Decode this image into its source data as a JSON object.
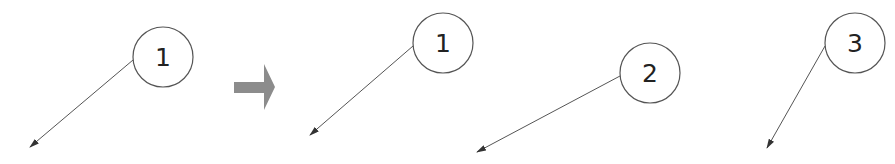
{
  "diagram": {
    "before": {
      "balloons": [
        {
          "label": "1",
          "cx": 163,
          "cy": 57,
          "r": 30,
          "leader": {
            "x1": 133,
            "y1": 60,
            "x2": 30,
            "y2": 147
          }
        }
      ]
    },
    "transition_arrow": {
      "color": "#8c8c8c"
    },
    "after": {
      "balloons": [
        {
          "label": "1",
          "cx": 443,
          "cy": 43,
          "r": 30,
          "leader": {
            "x1": 413,
            "y1": 46,
            "x2": 310,
            "y2": 135
          }
        },
        {
          "label": "2",
          "cx": 650,
          "cy": 73,
          "r": 30,
          "leader": {
            "x1": 620,
            "y1": 76,
            "x2": 477,
            "y2": 152
          }
        },
        {
          "label": "3",
          "cx": 855,
          "cy": 43,
          "r": 30,
          "leader": {
            "x1": 825,
            "y1": 46,
            "x2": 767,
            "y2": 148
          }
        }
      ]
    }
  }
}
